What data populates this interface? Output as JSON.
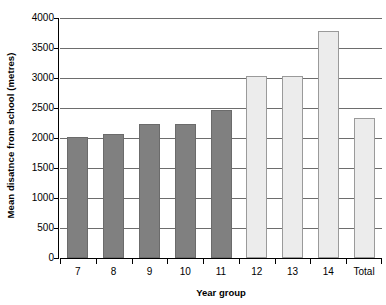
{
  "chart_data": {
    "type": "bar",
    "title": "",
    "xlabel": "Year group",
    "ylabel": "Mean disatnce from school (metres)",
    "categories": [
      "7",
      "8",
      "9",
      "10",
      "11",
      "12",
      "13",
      "14",
      "Total"
    ],
    "values": [
      2020,
      2070,
      2240,
      2230,
      2470,
      3030,
      3030,
      3780,
      2330
    ],
    "series": [
      {
        "name": "Mean distance from school",
        "values": [
          2020,
          2070,
          2240,
          2230,
          2470,
          3030,
          3030,
          3780,
          2330
        ]
      }
    ],
    "bar_styles": [
      "dark",
      "dark",
      "dark",
      "dark",
      "dark",
      "light",
      "light",
      "light",
      "light"
    ],
    "ylim": [
      0,
      4000
    ],
    "y_ticks": [
      0,
      500,
      1000,
      1500,
      2000,
      2500,
      3000,
      3500,
      4000
    ],
    "y_tick_labels": [
      "0",
      "500",
      "1000",
      "1500",
      "2000",
      "2500",
      "3000",
      "3500",
      "4000"
    ],
    "grid": "horizontal",
    "legend": "none",
    "colors": {
      "dark_bar": "#808080",
      "dark_bar_border": "#6b6b6b",
      "light_bar": "#ececec",
      "light_bar_border": "#9a9a9a",
      "gridline": "#6d6d6d",
      "axis": "#000000",
      "background": "#ffffff",
      "text": "#000000"
    }
  }
}
